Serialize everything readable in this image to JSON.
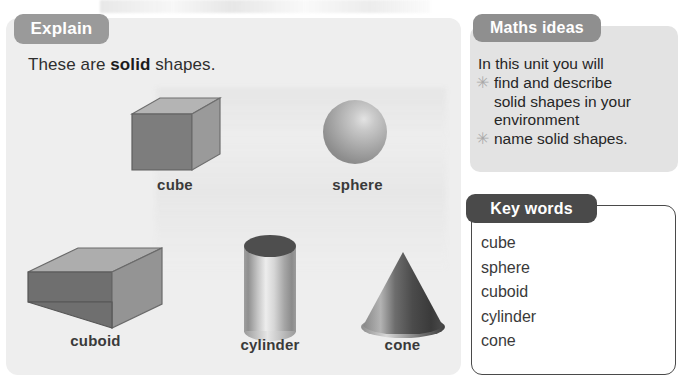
{
  "explain": {
    "tab_label": "Explain",
    "sentence_prefix": "These are ",
    "sentence_bold": "solid",
    "sentence_suffix": " shapes.",
    "shapes": [
      {
        "name": "cube",
        "label": "cube",
        "icon": "cube-3d-icon"
      },
      {
        "name": "sphere",
        "label": "sphere",
        "icon": "sphere-3d-icon"
      },
      {
        "name": "cuboid",
        "label": "cuboid",
        "icon": "cuboid-3d-icon"
      },
      {
        "name": "cylinder",
        "label": "cylinder",
        "icon": "cylinder-3d-icon"
      },
      {
        "name": "cone",
        "label": "cone",
        "icon": "cone-3d-icon"
      }
    ]
  },
  "maths_ideas": {
    "tab_label": "Maths ideas",
    "intro": "In this unit you will",
    "bullet_glyph": "✳",
    "items": [
      "find and describe",
      "solid shapes in your",
      "environment",
      "name solid shapes."
    ],
    "bulleted_flags": [
      true,
      false,
      false,
      true
    ]
  },
  "key_words": {
    "tab_label": "Key words",
    "words": [
      "cube",
      "sphere",
      "cuboid",
      "cylinder",
      "cone"
    ]
  },
  "colors": {
    "panel_bg": "#eeeeee",
    "maths_bg": "#e3e3e3",
    "explain_tab": "#9a9a9a",
    "maths_tab": "#8f8f8f",
    "keywords_tab": "#4a4a4a",
    "label_text": "#3a3a3a",
    "shape_gray_light": "#c9c9c9",
    "shape_gray_mid": "#8e8e8e",
    "shape_gray_dark": "#5a5a5a"
  }
}
